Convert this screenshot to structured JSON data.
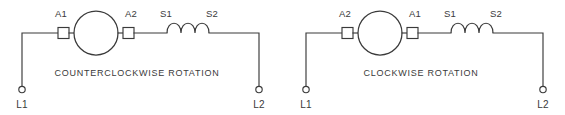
{
  "figure": {
    "line_color": "#3a3a3a",
    "background_color": "#ffffff"
  },
  "diagrams": [
    {
      "id": "counterclockwise",
      "caption": "COUNTERCLOCKWISE ROTATION",
      "armature_left_label": "A1",
      "armature_right_label": "A2",
      "field_left_label": "S1",
      "field_right_label": "S2",
      "terminal_left_label": "L1",
      "terminal_right_label": "L2",
      "motor_symbol": "armature-circle",
      "field_symbol": "series-field-coil",
      "coil_humps": "3"
    },
    {
      "id": "clockwise",
      "caption": "CLOCKWISE ROTATION",
      "armature_left_label": "A2",
      "armature_right_label": "A1",
      "field_left_label": "S1",
      "field_right_label": "S2",
      "terminal_left_label": "L1",
      "terminal_right_label": "L2",
      "motor_symbol": "armature-circle",
      "field_symbol": "series-field-coil",
      "coil_humps": "3"
    }
  ]
}
